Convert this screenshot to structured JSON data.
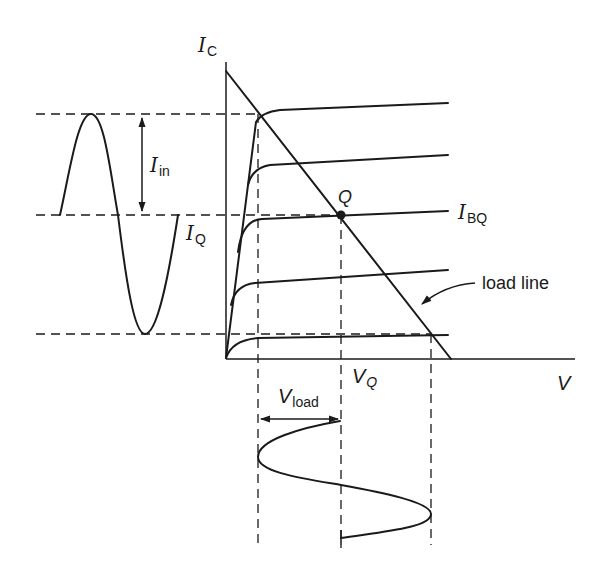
{
  "diagram": {
    "type": "BJT load-line analysis (collector characteristic curves)",
    "axes": {
      "y_axis_label": {
        "main": "I",
        "sub": "C"
      },
      "x_axis_label": "V"
    },
    "labels": {
      "input_current": {
        "main": "I",
        "sub": "in"
      },
      "quiescent_current": {
        "main": "I",
        "sub": "Q"
      },
      "base_quiescent": {
        "main": "I",
        "sub": "BQ"
      },
      "q_point": "Q",
      "quiescent_voltage": {
        "main": "V",
        "sub": "Q"
      },
      "load_voltage": {
        "main": "V",
        "sub": "load"
      },
      "load_line": "load line"
    },
    "characteristic_curves_count": 5,
    "waveforms": [
      "input current sine (left)",
      "output voltage sine (bottom)"
    ]
  }
}
